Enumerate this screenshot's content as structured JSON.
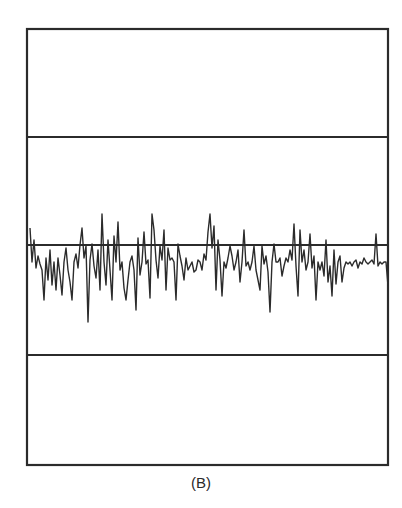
{
  "figure": {
    "caption": "(B)",
    "line_color": "#2b2b2b",
    "background": "#ffffff",
    "frame": {
      "x": 27,
      "y": 29,
      "width": 361,
      "height": 436
    },
    "horizontal_lines_y": [
      137,
      245,
      355
    ],
    "baseline_y": 245
  },
  "chart_data": {
    "type": "line",
    "title": "",
    "caption": "(B)",
    "xlabel": "",
    "ylabel": "",
    "grid": false,
    "points": [
      [
        30,
        228
      ],
      [
        32,
        262
      ],
      [
        34,
        240
      ],
      [
        36,
        268
      ],
      [
        38,
        256
      ],
      [
        40,
        264
      ],
      [
        42,
        270
      ],
      [
        44,
        300
      ],
      [
        46,
        258
      ],
      [
        48,
        280
      ],
      [
        50,
        250
      ],
      [
        52,
        285
      ],
      [
        54,
        262
      ],
      [
        56,
        290
      ],
      [
        58,
        258
      ],
      [
        60,
        275
      ],
      [
        62,
        295
      ],
      [
        64,
        262
      ],
      [
        66,
        248
      ],
      [
        68,
        270
      ],
      [
        70,
        282
      ],
      [
        72,
        300
      ],
      [
        74,
        262
      ],
      [
        76,
        254
      ],
      [
        78,
        268
      ],
      [
        80,
        245
      ],
      [
        82,
        228
      ],
      [
        84,
        258
      ],
      [
        86,
        246
      ],
      [
        88,
        322
      ],
      [
        90,
        260
      ],
      [
        92,
        244
      ],
      [
        94,
        266
      ],
      [
        96,
        278
      ],
      [
        98,
        250
      ],
      [
        100,
        290
      ],
      [
        102,
        214
      ],
      [
        104,
        262
      ],
      [
        106,
        285
      ],
      [
        108,
        240
      ],
      [
        110,
        270
      ],
      [
        112,
        300
      ],
      [
        114,
        236
      ],
      [
        116,
        262
      ],
      [
        118,
        222
      ],
      [
        120,
        270
      ],
      [
        122,
        262
      ],
      [
        124,
        288
      ],
      [
        126,
        300
      ],
      [
        128,
        280
      ],
      [
        130,
        262
      ],
      [
        132,
        256
      ],
      [
        134,
        270
      ],
      [
        136,
        310
      ],
      [
        138,
        238
      ],
      [
        140,
        275
      ],
      [
        142,
        262
      ],
      [
        144,
        232
      ],
      [
        146,
        264
      ],
      [
        148,
        260
      ],
      [
        150,
        298
      ],
      [
        152,
        214
      ],
      [
        154,
        230
      ],
      [
        156,
        260
      ],
      [
        158,
        278
      ],
      [
        160,
        246
      ],
      [
        162,
        260
      ],
      [
        164,
        230
      ],
      [
        166,
        290
      ],
      [
        168,
        248
      ],
      [
        170,
        260
      ],
      [
        172,
        258
      ],
      [
        174,
        262
      ],
      [
        176,
        300
      ],
      [
        178,
        244
      ],
      [
        180,
        256
      ],
      [
        182,
        266
      ],
      [
        184,
        280
      ],
      [
        186,
        258
      ],
      [
        188,
        270
      ],
      [
        190,
        266
      ],
      [
        192,
        262
      ],
      [
        194,
        272
      ],
      [
        196,
        270
      ],
      [
        198,
        260
      ],
      [
        200,
        262
      ],
      [
        202,
        270
      ],
      [
        204,
        254
      ],
      [
        206,
        260
      ],
      [
        208,
        232
      ],
      [
        210,
        214
      ],
      [
        212,
        248
      ],
      [
        214,
        226
      ],
      [
        216,
        290
      ],
      [
        218,
        240
      ],
      [
        220,
        260
      ],
      [
        222,
        296
      ],
      [
        224,
        262
      ],
      [
        226,
        268
      ],
      [
        228,
        258
      ],
      [
        230,
        246
      ],
      [
        232,
        256
      ],
      [
        234,
        270
      ],
      [
        236,
        262
      ],
      [
        238,
        250
      ],
      [
        240,
        282
      ],
      [
        242,
        262
      ],
      [
        244,
        230
      ],
      [
        246,
        266
      ],
      [
        248,
        262
      ],
      [
        250,
        270
      ],
      [
        252,
        262
      ],
      [
        254,
        246
      ],
      [
        256,
        270
      ],
      [
        258,
        280
      ],
      [
        260,
        290
      ],
      [
        262,
        246
      ],
      [
        264,
        264
      ],
      [
        266,
        256
      ],
      [
        268,
        272
      ],
      [
        270,
        312
      ],
      [
        272,
        262
      ],
      [
        274,
        244
      ],
      [
        276,
        262
      ],
      [
        278,
        262
      ],
      [
        280,
        258
      ],
      [
        282,
        276
      ],
      [
        284,
        266
      ],
      [
        286,
        258
      ],
      [
        288,
        262
      ],
      [
        290,
        250
      ],
      [
        292,
        260
      ],
      [
        294,
        224
      ],
      [
        296,
        266
      ],
      [
        298,
        296
      ],
      [
        300,
        230
      ],
      [
        302,
        262
      ],
      [
        304,
        250
      ],
      [
        306,
        270
      ],
      [
        308,
        262
      ],
      [
        310,
        234
      ],
      [
        312,
        268
      ],
      [
        314,
        256
      ],
      [
        316,
        300
      ],
      [
        318,
        262
      ],
      [
        320,
        270
      ],
      [
        322,
        262
      ],
      [
        324,
        276
      ],
      [
        326,
        240
      ],
      [
        328,
        282
      ],
      [
        330,
        266
      ],
      [
        332,
        296
      ],
      [
        334,
        250
      ],
      [
        336,
        284
      ],
      [
        338,
        262
      ],
      [
        340,
        256
      ],
      [
        342,
        282
      ],
      [
        344,
        268
      ],
      [
        346,
        262
      ],
      [
        348,
        264
      ],
      [
        350,
        262
      ],
      [
        352,
        266
      ],
      [
        354,
        262
      ],
      [
        356,
        260
      ],
      [
        358,
        268
      ],
      [
        360,
        262
      ],
      [
        362,
        264
      ],
      [
        364,
        258
      ],
      [
        366,
        262
      ],
      [
        368,
        264
      ],
      [
        370,
        262
      ],
      [
        372,
        260
      ],
      [
        374,
        264
      ],
      [
        376,
        234
      ],
      [
        378,
        266
      ],
      [
        380,
        262
      ],
      [
        382,
        264
      ],
      [
        384,
        262
      ],
      [
        386,
        262
      ],
      [
        388,
        286
      ]
    ],
    "reference_line_y": 245,
    "xlim": [
      27,
      388
    ],
    "ylim": [
      29,
      465
    ]
  }
}
